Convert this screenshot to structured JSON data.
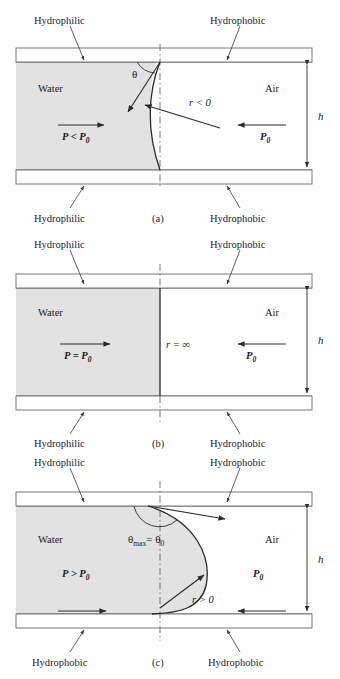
{
  "figure": {
    "type": "diagram",
    "panels": [
      {
        "id": "a",
        "caption": "(a)",
        "labels": {
          "top_left_wall": "Hydrophilic",
          "top_right_wall": "Hydrophobic",
          "bottom_left_wall": "Hydrophilic",
          "bottom_right_wall": "Hydrophobic",
          "left_phase": "Water",
          "right_phase": "Air",
          "left_pressure": "P < P",
          "left_pressure_sub": "0",
          "right_pressure": "P",
          "right_pressure_sub": "0",
          "radius": "r < 0",
          "angle": "θ",
          "height": "h"
        }
      },
      {
        "id": "b",
        "caption": "(b)",
        "labels": {
          "top_left_wall": "Hydrophilic",
          "top_right_wall": "Hydrophobic",
          "bottom_left_wall": "Hydrophilic",
          "bottom_right_wall": "Hydrophobic",
          "left_phase": "Water",
          "right_phase": "Air",
          "left_pressure": "P = P",
          "left_pressure_sub": "0",
          "right_pressure": "P",
          "right_pressure_sub": "0",
          "radius": "r = ∞",
          "height": "h"
        }
      },
      {
        "id": "c",
        "caption": "(c)",
        "labels": {
          "top_left_wall": "Hydrophilic",
          "top_right_wall": "Hydrophobic",
          "bottom_left_wall": "Hydrophobic",
          "bottom_right_wall": "Hydrophobic",
          "left_phase": "Water",
          "right_phase": "Air",
          "left_pressure": "P > P",
          "left_pressure_sub": "0",
          "right_pressure": "P",
          "right_pressure_sub": "0",
          "radius": "r > 0",
          "angle": "θ",
          "angle_sub": "max",
          "angle_eq": "= θ",
          "angle_eq_sub": "0",
          "height": "h"
        }
      }
    ],
    "colors": {
      "water_fill": "#e2e2e2",
      "wall_fill": "#ffffff",
      "line": "#2b2b2b",
      "background": "#ffffff"
    }
  }
}
